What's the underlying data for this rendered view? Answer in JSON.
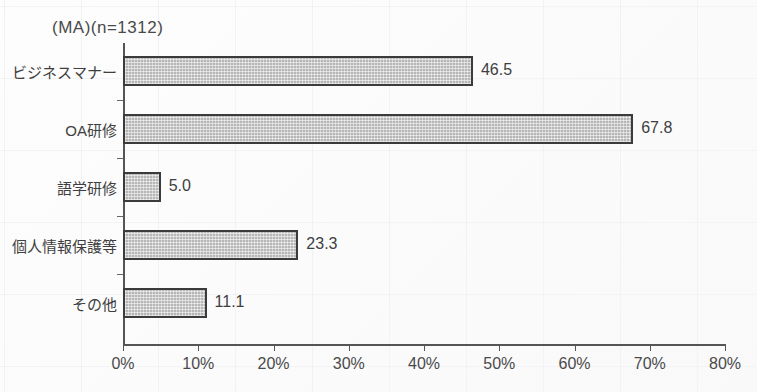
{
  "chart_data": {
    "type": "bar",
    "orientation": "horizontal",
    "title": "(MA)(n=1312)",
    "xlabel": "",
    "ylabel": "",
    "xlim": [
      0,
      80
    ],
    "grid": false,
    "legend": null,
    "categories": [
      "ビジネスマナー",
      "OA研修",
      "語学研修",
      "個人情報保護等",
      "その他"
    ],
    "values": [
      46.5,
      67.8,
      5.0,
      23.3,
      11.1
    ],
    "value_labels": [
      "46.5",
      "67.8",
      "5.0",
      "23.3",
      "11.1"
    ],
    "xticks": [
      0,
      10,
      20,
      30,
      40,
      50,
      60,
      70,
      80
    ],
    "xtick_labels": [
      "0%",
      "10%",
      "20%",
      "30%",
      "40%",
      "50%",
      "60%",
      "70%",
      "80%"
    ]
  },
  "style": {
    "bar_fill": "#b6b6b6",
    "bar_border": "#3b3b3b",
    "axis_color": "#555555",
    "text_color": "#3f3f3f",
    "background": "#fdfdfd"
  }
}
